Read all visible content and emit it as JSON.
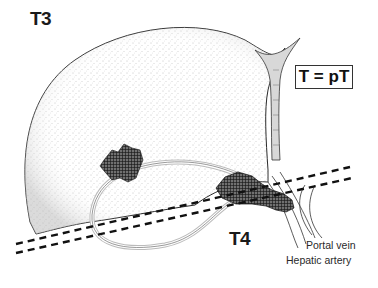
{
  "figure": {
    "title": "T3",
    "box_label": "T = pT",
    "tumor_label": "T4",
    "structures": {
      "portal_vein": "Portal vein",
      "hepatic_artery": "Hepatic artery"
    }
  },
  "colors": {
    "ink": "#1a1a1a",
    "stipple": "#9a9a9a",
    "background": "#ffffff"
  }
}
